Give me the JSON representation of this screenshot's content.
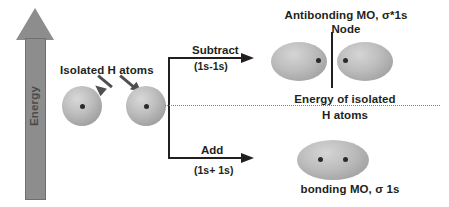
{
  "diagram": {
    "energy_axis": {
      "label": "Energy",
      "icon": "up-arrow-icon"
    },
    "isolated_atoms": {
      "label": "Isolated H atoms",
      "atom_count": 2
    },
    "operations": {
      "subtract": {
        "label": "Subtract",
        "sublabel": "(1s-1s)"
      },
      "add": {
        "label": "Add",
        "sublabel": "(1s+ 1s)"
      }
    },
    "antibonding": {
      "label": "Antibonding MO, σ*1s",
      "node_label": "Node"
    },
    "reference_line": {
      "label_line1": "Energy of isolated",
      "label_line2": "H atoms"
    },
    "bonding": {
      "label": "bonding MO, σ 1s"
    },
    "colors": {
      "orbital_gray": "#bdbdbd",
      "axis_gray": "#8d8d8d",
      "text_dark": "#231f20",
      "dotted_gray": "#7b7b7b"
    }
  },
  "chart_data": {
    "type": "diagram",
    "levels": [
      {
        "name": "Antibonding MO, σ*1s",
        "relative_energy": "above reference",
        "operation": "Subtract (1s-1s)",
        "features": [
          "Node"
        ]
      },
      {
        "name": "Energy of isolated H atoms",
        "relative_energy": "reference",
        "operation": "",
        "features": [
          "dotted reference line"
        ]
      },
      {
        "name": "bonding MO, σ 1s",
        "relative_energy": "below reference",
        "operation": "Add (1s+ 1s)",
        "features": []
      }
    ]
  }
}
